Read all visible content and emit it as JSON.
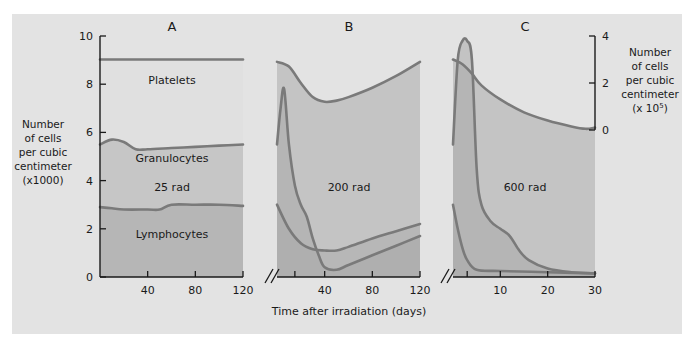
{
  "chart_data": {
    "type": "area",
    "title": "",
    "xlabel": "Time after irradiation (days)",
    "ylabel_left": [
      "Number",
      "of cells",
      "per cubic",
      "centimeter",
      "(x1000)"
    ],
    "ylabel_right": [
      "Number",
      "of cells",
      "per cubic",
      "centimeter",
      "(x 10^5)"
    ],
    "left_axis": {
      "range": [
        0,
        10
      ],
      "ticks": [
        "0",
        "2",
        "4",
        "6",
        "8",
        "10"
      ]
    },
    "right_axis": {
      "range": [
        0,
        4
      ],
      "ticks": [
        "0",
        "2",
        "4"
      ]
    },
    "colors": {
      "background": "#e3e3e3",
      "line": "#7a7a7a",
      "platelet_fill_a": "#e0e0e0",
      "granulocyte_fill": "#c6c6c6",
      "lymphocyte_fill": "#b6b6b6",
      "panel_fill": "#c4c4c4",
      "overlap_fill": "#a9a9a9",
      "axis": "#1a1a1a"
    },
    "panels": [
      {
        "id": "A",
        "label": "A",
        "dose": "25 rad",
        "x_ticks": [
          "40",
          "80",
          "120"
        ],
        "x_range": [
          0,
          120
        ],
        "region_labels": [
          "Platelets",
          "Granulocytes",
          "Lymphocytes"
        ],
        "series": [
          {
            "name": "Platelets (x10^5, right axis)",
            "x": [
              0,
              120
            ],
            "values": [
              3.0,
              3.0
            ]
          },
          {
            "name": "Granulocytes+Lymphocytes top (x1000)",
            "x": [
              0,
              10,
              20,
              30,
              40,
              60,
              80,
              100,
              120
            ],
            "values": [
              5.5,
              5.7,
              5.6,
              5.3,
              5.3,
              5.35,
              5.4,
              5.45,
              5.5
            ]
          },
          {
            "name": "Lymphocytes (x1000)",
            "x": [
              0,
              10,
              20,
              40,
              50,
              60,
              80,
              100,
              120
            ],
            "values": [
              2.9,
              2.85,
              2.8,
              2.8,
              2.8,
              3.0,
              3.0,
              3.0,
              2.95
            ]
          }
        ]
      },
      {
        "id": "B",
        "label": "B",
        "dose": "200 rad",
        "x_ticks": [
          "40",
          "80",
          "120"
        ],
        "x_range": [
          0,
          120
        ],
        "series": [
          {
            "name": "Platelets (x10^5, right axis)",
            "x": [
              0,
              10,
              20,
              30,
              40,
              50,
              60,
              80,
              100,
              120
            ],
            "values": [
              2.9,
              2.7,
              2.0,
              1.4,
              1.2,
              1.25,
              1.4,
              1.8,
              2.3,
              2.9
            ]
          },
          {
            "name": "Granulocytes (x1000)",
            "x": [
              0,
              3,
              6,
              10,
              15,
              20,
              25,
              30,
              35,
              40,
              50,
              60,
              80,
              100,
              120
            ],
            "values": [
              5.5,
              7.0,
              7.8,
              5.5,
              3.8,
              3.0,
              2.5,
              1.6,
              0.9,
              0.4,
              0.3,
              0.5,
              0.9,
              1.3,
              1.7
            ]
          },
          {
            "name": "Lymphocytes (x1000)",
            "x": [
              0,
              10,
              20,
              30,
              40,
              50,
              60,
              80,
              100,
              120
            ],
            "values": [
              3.0,
              2.0,
              1.4,
              1.15,
              1.1,
              1.1,
              1.25,
              1.6,
              1.9,
              2.2
            ]
          }
        ]
      },
      {
        "id": "C",
        "label": "C",
        "dose": "600 rad",
        "x_ticks": [
          "10",
          "20",
          "30"
        ],
        "x_range": [
          0,
          30
        ],
        "series": [
          {
            "name": "Platelets (x10^5, right axis)",
            "x": [
              0,
              2,
              4,
              6,
              10,
              15,
              20,
              25,
              28,
              30
            ],
            "values": [
              3.0,
              2.8,
              2.4,
              1.9,
              1.3,
              0.75,
              0.4,
              0.15,
              0.05,
              0.1
            ]
          },
          {
            "name": "Granulocytes (x1000)",
            "x": [
              0,
              1,
              2,
              3,
              4,
              5,
              6,
              8,
              10,
              12,
              14,
              16,
              20,
              25,
              30
            ],
            "values": [
              5.5,
              9.0,
              9.8,
              9.8,
              9.0,
              4.5,
              3.0,
              2.3,
              2.0,
              1.7,
              1.1,
              0.7,
              0.35,
              0.2,
              0.15
            ]
          },
          {
            "name": "Lymphocytes (x1000)",
            "x": [
              0,
              1,
              2,
              3,
              5,
              10,
              20,
              30
            ],
            "values": [
              3.0,
              2.0,
              1.2,
              0.7,
              0.3,
              0.25,
              0.2,
              0.15
            ]
          }
        ]
      }
    ]
  }
}
